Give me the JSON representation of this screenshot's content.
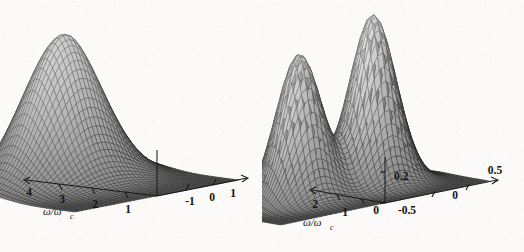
{
  "figure": {
    "background_color": "#fbfaf8",
    "ink_color": "#141414",
    "panel_count": 2
  },
  "chart_data": [
    {
      "type": "surface",
      "panel": "left",
      "title": "",
      "xlabel": "ω/ωc",
      "ylabel": "",
      "zlabel": "",
      "x_ticks": [
        "4",
        "3",
        "2",
        "1"
      ],
      "x_values": [
        4,
        3,
        2,
        1
      ],
      "xlim": [
        0,
        4.5
      ],
      "y_ticks": [
        "-1",
        "0",
        "1"
      ],
      "y_values": [
        -1,
        0,
        1
      ],
      "ylim": [
        -1.4,
        1.4
      ],
      "z_ticks": [],
      "zlim": [
        0,
        1
      ],
      "grid": false,
      "legend": "none",
      "mesh": "wireframe-shaded",
      "description": "single broad ridge, maximum near omega/omega_c = 1 and angle 0, decaying toward large omega/omega_c",
      "peaks": [
        {
          "x": 1.0,
          "y": 0.0,
          "z": 1.0
        }
      ],
      "surface_model": {
        "kind": "single-ridge",
        "sigma_x": 1.15,
        "sigma_y": 0.62,
        "x0": 0.95
      }
    },
    {
      "type": "surface",
      "panel": "right",
      "title": "",
      "xlabel": "ω/ωc",
      "ylabel": "",
      "zlabel": "",
      "x_ticks": [
        "2",
        "1"
      ],
      "x_values": [
        2,
        1
      ],
      "xlim": [
        0,
        2.4
      ],
      "y_ticks": [
        "-0.5",
        "0",
        "0.5"
      ],
      "y_values": [
        -0.5,
        0,
        0.5
      ],
      "ylim": [
        -0.65,
        0.65
      ],
      "z_ticks": [
        "0",
        "0.2"
      ],
      "z_values": [
        0,
        0.2
      ],
      "zlim": [
        0,
        0.26
      ],
      "grid": false,
      "legend": "none",
      "mesh": "wireframe-shaded",
      "description": "bimodal surface with two peaks separated by a saddle valley at angle 0, flat tail at large omega/omega_c",
      "peaks": [
        {
          "x": 0.85,
          "y": -0.22,
          "z": 0.2
        },
        {
          "x": 0.85,
          "y": 0.22,
          "z": 0.24
        }
      ],
      "surface_model": {
        "kind": "double-peak",
        "sigma_x": 0.55,
        "sigma_y": 0.17,
        "x0": 0.85,
        "y_split": 0.22
      }
    }
  ],
  "left_panel": {
    "axis_omega": {
      "label": "ω/ωc",
      "label_main": "ω/ω",
      "label_sub": "c",
      "ticks": [
        "4",
        "3",
        "2",
        "1"
      ]
    },
    "axis_angle": {
      "label": "",
      "ticks": [
        "-1",
        "0",
        "1"
      ]
    },
    "axis_vertical": {
      "label": "",
      "ticks": []
    }
  },
  "right_panel": {
    "axis_omega": {
      "label": "ω/ωc",
      "label_main": "ω/ω",
      "label_sub": "c",
      "ticks": [
        "2",
        "1"
      ]
    },
    "axis_angle": {
      "label": "",
      "ticks": [
        "-0.5",
        "0",
        "0.5"
      ]
    },
    "axis_vertical": {
      "label": "",
      "ticks": [
        "0",
        "0.2"
      ]
    }
  }
}
